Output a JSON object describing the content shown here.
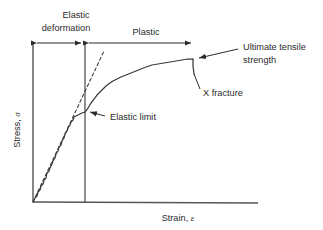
{
  "figure": {
    "background_color": "#ffffff",
    "line_color": "#3a3a3a",
    "text_color": "#2b2b2b"
  },
  "axes": {
    "y_label_text": "Stress, ",
    "y_label_symbol": "σ",
    "x_label_text": "Strain, ",
    "x_label_symbol": "ε",
    "y_axis_name": "stress-axis",
    "x_axis_name": "strain-axis"
  },
  "regions": [
    {
      "id": "elastic",
      "label_line1": "Elastic",
      "label_line2": "deformation",
      "x_start": 33,
      "x_end": 85,
      "bar_y": 43
    },
    {
      "id": "plastic",
      "label_line1": "Plastic",
      "label_line2": "",
      "x_start": 85,
      "x_end": 195,
      "bar_y": 43
    }
  ],
  "annotations": [
    {
      "id": "ultimate-tensile-strength",
      "line1": "Ultimate tensile",
      "line2": "strength",
      "text_x": 245,
      "text_y": 47,
      "leader_from_x": 238,
      "leader_from_y": 49,
      "point_x": 193,
      "point_y": 59
    },
    {
      "id": "x-fracture",
      "line1": "X fracture",
      "line2": "",
      "text_x": 202,
      "text_y": 95,
      "leader_from_x": 200,
      "leader_from_y": 90,
      "point_x": 194,
      "point_y": 74
    },
    {
      "id": "elastic-limit",
      "line1": "Elastic limit",
      "line2": "",
      "text_x": 108,
      "text_y": 119,
      "leader_from_x": 105,
      "leader_from_y": 116,
      "point_x": 86,
      "point_y": 112
    }
  ],
  "chart_data": {
    "type": "line",
    "xlabel": "Strain, ε",
    "ylabel": "Stress, σ",
    "grid": false,
    "legend": "none",
    "xlim": [
      0,
      1
    ],
    "ylim": [
      0,
      1
    ],
    "series": [
      {
        "name": "stress-strain-curve",
        "comment": "pixel path of the plotted specimen curve, noisy elastic ramp then plastic plateau and fracture drop",
        "points": [
          [
            33,
            202
          ],
          [
            35,
            198
          ],
          [
            37,
            196
          ],
          [
            38,
            192
          ],
          [
            40,
            190
          ],
          [
            41,
            186
          ],
          [
            43,
            184
          ],
          [
            44,
            180
          ],
          [
            46,
            178
          ],
          [
            47,
            173
          ],
          [
            49,
            171
          ],
          [
            50,
            168
          ],
          [
            52,
            164
          ],
          [
            53,
            161
          ],
          [
            55,
            158
          ],
          [
            56,
            154
          ],
          [
            58,
            151
          ],
          [
            59,
            147
          ],
          [
            61,
            145
          ],
          [
            62,
            141
          ],
          [
            64,
            138
          ],
          [
            65,
            134
          ],
          [
            67,
            131
          ],
          [
            68,
            128
          ],
          [
            70,
            125
          ],
          [
            71,
            122
          ],
          [
            73,
            120
          ],
          [
            74,
            117
          ],
          [
            76,
            116
          ],
          [
            78,
            115
          ],
          [
            80,
            114
          ],
          [
            82,
            113
          ],
          [
            85,
            112
          ],
          [
            88,
            108
          ],
          [
            91,
            103
          ],
          [
            94,
            99
          ],
          [
            97,
            95
          ],
          [
            100,
            92
          ],
          [
            103,
            89
          ],
          [
            106,
            86
          ],
          [
            110,
            83
          ],
          [
            113,
            81
          ],
          [
            117,
            79
          ],
          [
            121,
            77
          ],
          [
            126,
            75
          ],
          [
            131,
            73
          ],
          [
            136,
            71
          ],
          [
            141,
            69
          ],
          [
            146,
            67
          ],
          [
            152,
            65
          ],
          [
            158,
            64
          ],
          [
            164,
            63
          ],
          [
            170,
            62
          ],
          [
            176,
            61
          ],
          [
            182,
            60
          ],
          [
            188,
            59
          ],
          [
            193,
            59
          ]
        ]
      },
      {
        "name": "fracture-drop",
        "comment": "vertical drop from ultimate tensile strength to fracture",
        "points": [
          [
            193,
            59
          ],
          [
            193,
            66
          ],
          [
            194,
            74
          ]
        ]
      },
      {
        "name": "elastic-modulus-tangent",
        "style": "dashed",
        "comment": "dashed straight tangent showing linear elastic slope",
        "points": [
          [
            33,
            202
          ],
          [
            104,
            51
          ]
        ]
      }
    ],
    "key_points": [
      {
        "name": "origin",
        "x": 33,
        "y": 202
      },
      {
        "name": "elastic-limit",
        "x": 85,
        "y": 112
      },
      {
        "name": "ultimate-tensile-strength",
        "x": 193,
        "y": 59
      },
      {
        "name": "fracture",
        "x": 194,
        "y": 74
      }
    ]
  }
}
